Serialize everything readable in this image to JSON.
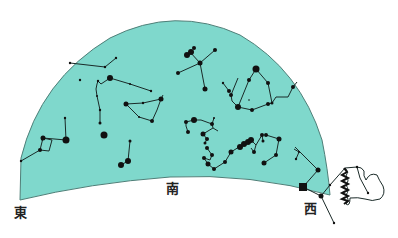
{
  "chart": {
    "title": "",
    "sky_color": "#7fd8cc",
    "sky_border_color": "#4f7f78",
    "star_color": "#111111",
    "line_color": "#1a2a28"
  },
  "directions": {
    "east": "東",
    "south": "南",
    "west": "西"
  },
  "constellations": [
    {
      "name": "upper-left-line",
      "stars": [
        [
          70,
          63,
          1.2
        ],
        [
          105,
          67,
          1.2
        ],
        [
          116,
          58,
          1.2
        ]
      ]
    },
    {
      "name": "upper-left-isolated",
      "stars": [
        [
          80,
          80,
          1.2
        ]
      ]
    },
    {
      "name": "upper-middle-hook",
      "stars": [
        [
          98,
          81,
          1.2
        ],
        [
          97,
          84,
          1
        ],
        [
          96,
          89,
          1
        ],
        [
          97,
          96,
          1
        ],
        [
          100,
          110,
          1.2
        ],
        [
          100,
          123,
          1.5
        ],
        [
          110,
          78,
          3
        ],
        [
          130,
          84,
          1
        ],
        [
          151,
          91,
          1.2
        ]
      ]
    },
    {
      "name": "middle-triangle",
      "stars": [
        [
          126,
          104,
          2.5
        ],
        [
          143,
          103,
          1.2
        ],
        [
          161,
          99,
          2.5
        ],
        [
          157,
          110,
          1
        ],
        [
          152,
          121,
          2
        ],
        [
          139,
          117,
          1
        ]
      ]
    },
    {
      "name": "top-center-cluster",
      "stars": [
        [
          187,
          55,
          3
        ],
        [
          190,
          52,
          3
        ],
        [
          193,
          52,
          2
        ],
        [
          194,
          48,
          2
        ],
        [
          215,
          50,
          2
        ],
        [
          200,
          63,
          2.5
        ],
        [
          178,
          73,
          2
        ],
        [
          205,
          89,
          2.5
        ]
      ]
    },
    {
      "name": "small-pair",
      "stars": [
        [
          223,
          83,
          1.2
        ],
        [
          229,
          91,
          2
        ]
      ]
    },
    {
      "name": "pentagon",
      "stars": [
        [
          256,
          69,
          3.5
        ],
        [
          249,
          80,
          2
        ],
        [
          268,
          83,
          2
        ],
        [
          238,
          78,
          1
        ],
        [
          231,
          95,
          2
        ],
        [
          238,
          107,
          3
        ],
        [
          252,
          110,
          2
        ],
        [
          268,
          104,
          2
        ],
        [
          272,
          103,
          1.5
        ],
        [
          276,
          97,
          1.2
        ],
        [
          288,
          97,
          1.2
        ],
        [
          293,
          87,
          1.5
        ]
      ]
    },
    {
      "name": "center-cluster",
      "stars": [
        [
          186,
          122,
          2
        ],
        [
          194,
          120,
          3
        ],
        [
          186,
          126,
          1.5
        ],
        [
          188,
          132,
          2
        ],
        [
          201,
          120,
          1
        ],
        [
          212,
          124,
          2
        ],
        [
          213,
          128,
          1.5
        ],
        [
          214,
          118,
          1
        ],
        [
          203,
          134,
          2.5
        ],
        [
          207,
          139,
          2
        ],
        [
          205,
          143,
          1.5
        ],
        [
          209,
          147,
          1.5
        ],
        [
          221,
          130,
          1.5
        ],
        [
          216,
          124,
          1
        ]
      ]
    },
    {
      "name": "center-lower-cluster",
      "stars": [
        [
          207,
          148,
          2
        ],
        [
          212,
          155,
          2
        ],
        [
          210,
          160,
          2
        ],
        [
          204,
          158,
          2
        ],
        [
          208,
          164,
          2.5
        ],
        [
          214,
          169,
          2
        ],
        [
          225,
          162,
          2
        ],
        [
          231,
          152,
          2.5
        ],
        [
          239,
          147,
          3
        ],
        [
          242,
          144,
          3
        ],
        [
          246,
          143,
          3
        ],
        [
          248,
          141,
          3
        ],
        [
          251,
          140,
          3
        ],
        [
          251,
          148,
          1.5
        ],
        [
          254,
          152,
          2
        ],
        [
          256,
          145,
          1
        ],
        [
          262,
          135,
          2
        ],
        [
          263,
          141,
          1.5
        ]
      ]
    },
    {
      "name": "right-lower-hook",
      "stars": [
        [
          266,
          135,
          2
        ],
        [
          279,
          139,
          2.5
        ],
        [
          276,
          155,
          2
        ],
        [
          264,
          163,
          2.5
        ]
      ]
    },
    {
      "name": "lower-left-rect",
      "stars": [
        [
          21,
          161,
          1.2
        ],
        [
          40,
          150,
          2
        ],
        [
          43,
          138,
          2.5
        ],
        [
          49,
          151,
          1
        ],
        [
          66,
          140,
          3.5
        ],
        [
          65,
          118,
          1.2
        ]
      ]
    },
    {
      "name": "lone-bright",
      "stars": [
        [
          104,
          135,
          3.5
        ]
      ]
    },
    {
      "name": "lower-middle-pair",
      "stars": [
        [
          130,
          141,
          1.5
        ],
        [
          128,
          161,
          3
        ],
        [
          121,
          165,
          3
        ]
      ]
    },
    {
      "name": "west-horizon-line",
      "stars": [
        [
          294,
          149,
          1.2
        ],
        [
          296,
          159,
          1.2
        ],
        [
          299,
          152,
          1
        ],
        [
          318,
          170,
          2.5
        ],
        [
          303,
          187,
          4
        ],
        [
          321,
          196,
          2.5
        ],
        [
          330,
          185,
          1.2
        ],
        [
          345,
          168,
          2.5
        ],
        [
          357,
          167,
          1.2
        ],
        [
          368,
          193,
          1.2
        ],
        [
          334,
          223,
          1.2
        ]
      ]
    }
  ]
}
